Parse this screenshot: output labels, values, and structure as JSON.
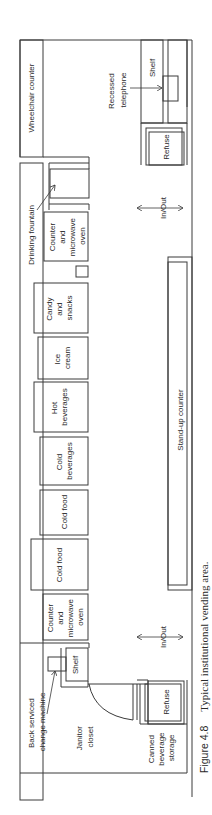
{
  "diagram": {
    "orientation": "rotated-90-ccw",
    "labels": {
      "wheelchair_counter": "Wheelchair counter",
      "recessed_telephone": [
        "Recessed",
        "telephone"
      ],
      "shelf_top": "Shelf",
      "refuse_top": "Refuse",
      "drinking_fountain": "Drinking fountain",
      "counter_microwave_top": [
        "Counter",
        "and",
        "microwave",
        "oven"
      ],
      "in_out_top": "In/Out",
      "candy_snacks": [
        "Candy",
        "and",
        "snacks"
      ],
      "ice_cream": [
        "Ice",
        "cream"
      ],
      "hot_beverages": [
        "Hot",
        "beverages"
      ],
      "cold_beverages": [
        "Cold",
        "beverages"
      ],
      "stand_up_counter": "Stand-up counter",
      "cold_food_1": "Cold food",
      "cold_food_2": "Cold food",
      "counter_microwave_bottom": [
        "Counter",
        "and",
        "microwave",
        "oven"
      ],
      "in_out_bottom": "In/Out",
      "shelf_bottom": "Shelf",
      "back_serviced_change_machine": [
        "Back serviced",
        "change machine"
      ],
      "janitor_closet": [
        "Janitor",
        "closet"
      ],
      "refuse_bottom": "Refuse",
      "canned_beverage_storage": [
        "Canned",
        "beverage",
        "storage"
      ]
    },
    "caption": {
      "figure_number": "Figure 4.8",
      "text": "Typical institutional vending area."
    }
  }
}
